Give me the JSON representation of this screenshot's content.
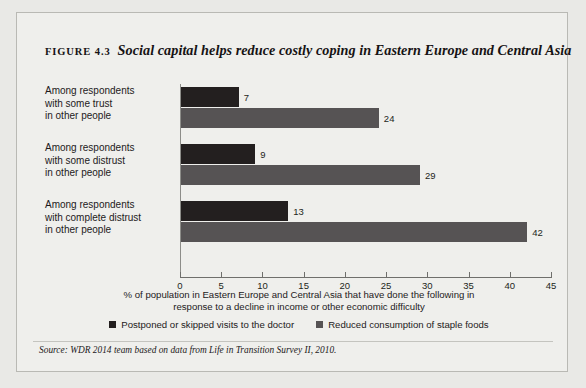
{
  "figure": {
    "label": "FIGURE 4.3",
    "title": "Social capital helps reduce costly coping in Eastern Europe and Central Asia",
    "source": "Source: WDR 2014 team based on data from Life in Transition Survey II, 2010."
  },
  "chart_data": {
    "type": "bar",
    "orientation": "horizontal",
    "title": "Social capital helps reduce costly coping in Eastern Europe and Central Asia",
    "categories": [
      "Among respondents with some trust in other people",
      "Among respondents with some distrust in other people",
      "Among respondents with complete distrust in other people"
    ],
    "category_lines": [
      [
        "Among respondents",
        "with some trust",
        "in other people"
      ],
      [
        "Among respondents",
        "with some distrust",
        "in other people"
      ],
      [
        "Among respondents",
        "with complete distrust",
        "in other people"
      ]
    ],
    "series": [
      {
        "name": "Postponed or skipped visits to the doctor",
        "color": "#231f1f",
        "values": [
          7,
          9,
          13
        ]
      },
      {
        "name": "Reduced consumption of staple foods",
        "color": "#565354",
        "values": [
          24,
          29,
          42
        ]
      }
    ],
    "xlabel_lines": [
      "% of population in Eastern Europe and Central Asia that have done the following in",
      "response to a decline in income or other economic difficulty"
    ],
    "xlabel": "% of population in Eastern Europe and Central Asia that have done the following in response to a decline in income or other economic difficulty",
    "ylabel": "",
    "xlim": [
      0,
      45
    ],
    "xticks": [
      0,
      5,
      10,
      15,
      20,
      25,
      30,
      35,
      40,
      45
    ],
    "grid": false,
    "legend_position": "bottom"
  }
}
